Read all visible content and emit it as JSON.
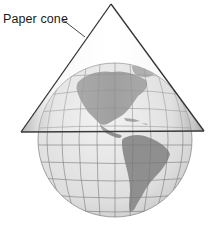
{
  "diagram": {
    "label": "Paper cone",
    "colors": {
      "background": "#ffffff",
      "ocean": "#e4e4e4",
      "land": "#8f8f8f",
      "graticule": "#7a7a7a",
      "cone_fill": "#d9d9d9",
      "cone_edge": "#333333",
      "text": "#1a1a1a"
    },
    "cone": {
      "apex": [
        111,
        4
      ],
      "base_left": [
        21,
        132
      ],
      "base_right": [
        204,
        131
      ]
    },
    "globe": {
      "center": [
        115,
        140
      ],
      "radius": 77
    },
    "visible_landmasses": [
      "North America",
      "Central America",
      "Caribbean islands",
      "South America",
      "Greenland (edge)"
    ]
  }
}
